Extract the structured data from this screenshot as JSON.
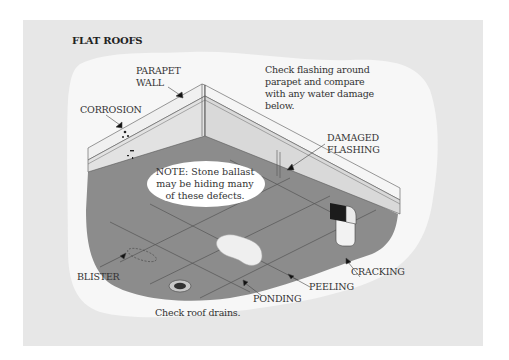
{
  "title": "FLAT ROOFS",
  "labels": {
    "parapet_wall": [
      "PARAPET",
      "WALL"
    ],
    "corrosion": "CORROSION",
    "check_flashing": [
      "Check flashing around",
      "parapet and compare",
      "with any water damage",
      "below."
    ],
    "damaged_flashing": [
      "DAMAGED",
      "FLASHING"
    ],
    "note": [
      "NOTE: Stone ballast",
      "may be hiding many",
      "of these defects."
    ],
    "blister": "BLISTER",
    "cracking": "CRACKING",
    "peeling": "PEELING",
    "ponding": "PONDING",
    "check_drains": "Check roof drains."
  },
  "colors": {
    "panel": "#e7e7e7",
    "blob": "#f7f7f7",
    "roof": "#8c8c8c",
    "wall_face": "#e2e2e2",
    "wall_top": "#f0f0f0",
    "line": "#555555"
  }
}
